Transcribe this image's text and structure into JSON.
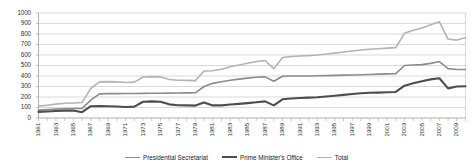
{
  "chart_data": {
    "type": "line",
    "title": "",
    "xlabel": "",
    "ylabel": "",
    "ylim": [
      0,
      1000
    ],
    "ytick_step": 100,
    "yticks": [
      "0",
      "100",
      "200",
      "300",
      "400",
      "500",
      "600",
      "700",
      "800",
      "900",
      "1000"
    ],
    "grid": true,
    "legend_position": "bottom",
    "x": [
      1961,
      1962,
      1963,
      1964,
      1965,
      1966,
      1967,
      1968,
      1969,
      1970,
      1971,
      1972,
      1973,
      1974,
      1975,
      1976,
      1977,
      1978,
      1979,
      1980,
      1981,
      1982,
      1983,
      1984,
      1985,
      1986,
      1987,
      1988,
      1989,
      1990,
      1991,
      1992,
      1993,
      1994,
      1995,
      1996,
      1997,
      1998,
      1999,
      2000,
      2001,
      2002,
      2003,
      2004,
      2005,
      2006,
      2007,
      2008,
      2009,
      2010
    ],
    "xticks": [
      "1961",
      "1963",
      "1965",
      "1967",
      "1969",
      "1971",
      "1973",
      "1975",
      "1977",
      "1979",
      "1981",
      "1983",
      "1985",
      "1987",
      "1989",
      "1991",
      "1993",
      "1995",
      "1997",
      "1999",
      "2001",
      "2003",
      "2005",
      "2007",
      "2009"
    ],
    "series": [
      {
        "name": "Presidential Secretariat",
        "color": "#8c8c8c",
        "width": 1.6,
        "values": [
          75,
          80,
          85,
          88,
          90,
          92,
          170,
          230,
          232,
          232,
          233,
          234,
          235,
          236,
          236,
          237,
          238,
          239,
          240,
          300,
          330,
          345,
          360,
          370,
          380,
          388,
          392,
          350,
          398,
          400,
          400,
          400,
          402,
          404,
          406,
          408,
          410,
          412,
          415,
          418,
          420,
          422,
          500,
          505,
          508,
          520,
          538,
          470,
          462,
          462
        ]
      },
      {
        "name": "Prime Minister's Office",
        "color": "#4d4d4d",
        "width": 2.1,
        "values": [
          58,
          62,
          66,
          70,
          72,
          55,
          112,
          114,
          112,
          110,
          105,
          108,
          155,
          158,
          155,
          130,
          122,
          120,
          118,
          148,
          120,
          120,
          128,
          135,
          142,
          150,
          158,
          120,
          178,
          186,
          190,
          194,
          198,
          205,
          212,
          220,
          228,
          236,
          240,
          242,
          245,
          248,
          308,
          330,
          350,
          368,
          378,
          282,
          300,
          302
        ]
      },
      {
        "name": "Total",
        "color": "#b3b3b3",
        "width": 1.6,
        "values": [
          113,
          122,
          132,
          140,
          143,
          147,
          282,
          344,
          346,
          344,
          338,
          342,
          390,
          394,
          392,
          367,
          360,
          358,
          356,
          448,
          450,
          465,
          488,
          505,
          522,
          538,
          548,
          470,
          576,
          586,
          590,
          594,
          600,
          609,
          618,
          628,
          638,
          648,
          655,
          660,
          665,
          670,
          808,
          835,
          858,
          888,
          916,
          752,
          742,
          764
        ]
      }
    ]
  },
  "legend": {
    "items": [
      {
        "label": "Presidential Secretariat",
        "color": "#8c8c8c",
        "width": "1.6px"
      },
      {
        "label": "Prime Minister's Office",
        "color": "#4d4d4d",
        "width": "2.2px"
      },
      {
        "label": "Total",
        "color": "#b3b3b3",
        "width": "1.6px"
      }
    ]
  },
  "plot": {
    "axis_color": "#a6a6a6",
    "grid_color": "#c9c9c9",
    "background": "#ffffff"
  }
}
